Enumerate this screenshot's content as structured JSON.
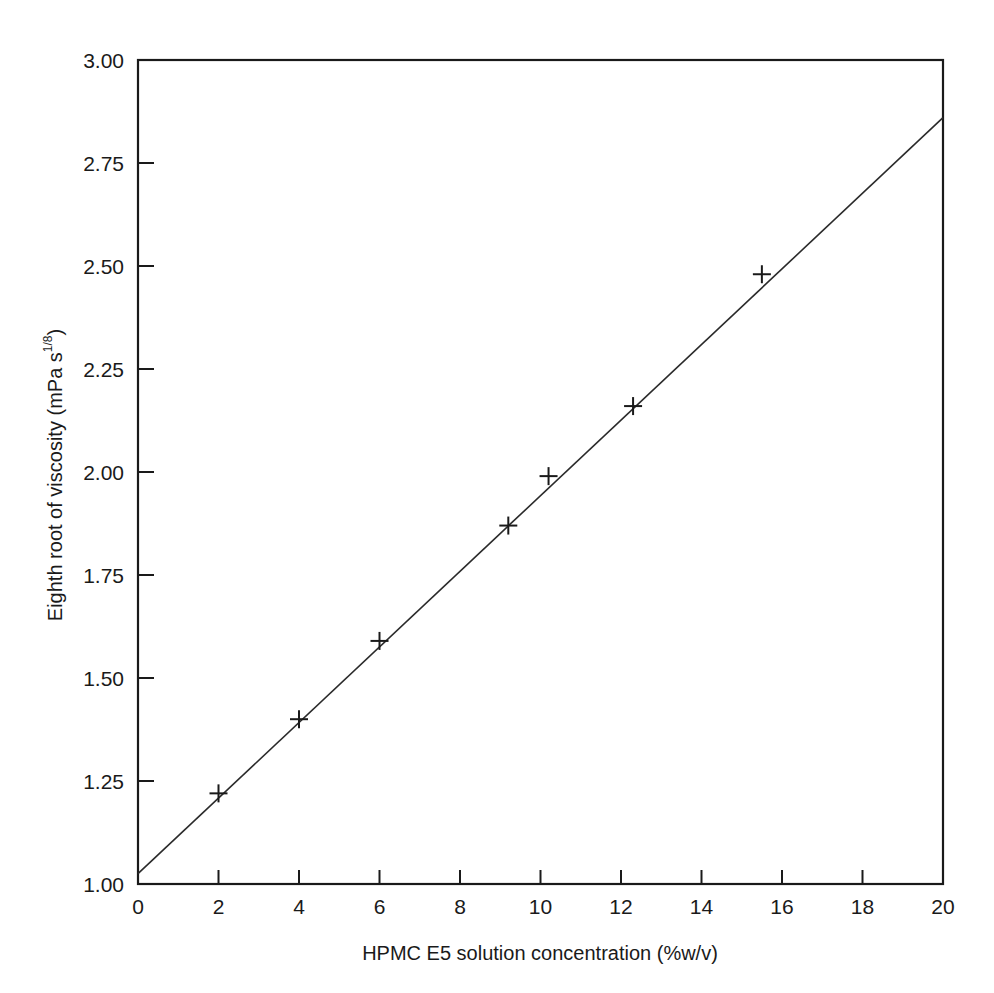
{
  "chart_data": {
    "type": "scatter",
    "title": "",
    "xlabel": "HPMC E5 solution concentration (%w/v)",
    "ylabel": "Eighth root of viscosity (mPa s",
    "ylabel_exponent": "1/8",
    "ylabel_close": ")",
    "xlim": [
      0,
      20
    ],
    "ylim": [
      1.0,
      3.0
    ],
    "x_ticks": [
      0,
      2,
      4,
      6,
      8,
      10,
      12,
      14,
      16,
      18,
      20
    ],
    "x_tick_labels": [
      "0",
      "2",
      "4",
      "6",
      "8",
      "10",
      "12",
      "14",
      "16",
      "18",
      "20"
    ],
    "y_ticks": [
      1.0,
      1.25,
      1.5,
      1.75,
      2.0,
      2.25,
      2.5,
      2.75,
      3.0
    ],
    "y_tick_labels": [
      "1.00",
      "1.25",
      "1.50",
      "1.75",
      "2.00",
      "2.25",
      "2.50",
      "2.75",
      "3.00"
    ],
    "grid": false,
    "legend": null,
    "marker": "plus",
    "series": [
      {
        "name": "measured",
        "x": [
          2.0,
          4.0,
          6.0,
          9.2,
          10.2,
          12.3,
          15.5
        ],
        "y": [
          1.22,
          1.4,
          1.59,
          1.87,
          1.99,
          2.16,
          2.48
        ]
      }
    ],
    "fit_line": {
      "name": "linear fit",
      "x": [
        0,
        20
      ],
      "y": [
        1.025,
        2.86
      ]
    }
  }
}
